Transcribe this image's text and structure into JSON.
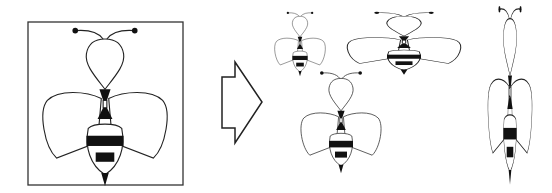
{
  "diagram": {
    "title": "",
    "nodes": [
      {
        "id": "original",
        "label": "",
        "kind": "framed-bee-icon"
      },
      {
        "id": "arrow",
        "label": "",
        "kind": "right-arrow"
      },
      {
        "id": "small",
        "label": "",
        "kind": "bee-scaled-small"
      },
      {
        "id": "wide",
        "label": "",
        "kind": "bee-stretched-horizontal"
      },
      {
        "id": "medium",
        "label": "",
        "kind": "bee-scaled-medium"
      },
      {
        "id": "tall",
        "label": "",
        "kind": "bee-stretched-vertical"
      }
    ],
    "colors": {
      "stroke": "#222222",
      "fill": "#ffffff",
      "stripe": "#111111"
    }
  }
}
